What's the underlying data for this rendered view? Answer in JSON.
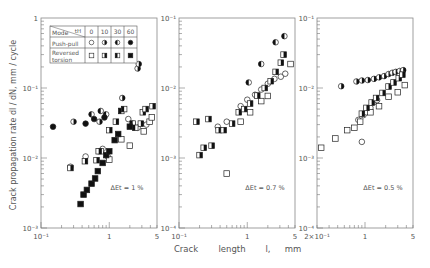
{
  "chart_data": {
    "type": "scatter",
    "title": "",
    "xlabel": "Crack length l, mm",
    "ylabel": "Crack propagation rate dl/dN, mm/cycle",
    "x_scale": "log",
    "y_scale": "log",
    "grid": false,
    "legend": {
      "position": "inside top-left of first panel (table)",
      "header": [
        "Mode \\ tH",
        "0",
        "10",
        "30",
        "60"
      ],
      "rows": [
        {
          "mode": "Push-pull",
          "markers": [
            "open circle",
            "right-half-filled circle",
            "left-half-filled circle",
            "filled circle"
          ]
        },
        {
          "mode": "Reversed torsion",
          "markers": [
            "open square",
            "right-half-filled square",
            "left-half-filled square",
            "filled square"
          ]
        }
      ]
    },
    "panels": [
      {
        "annotation": "ΔEt = 1 %",
        "xlim": [
          0.1,
          5
        ],
        "ylim": [
          0.001,
          1
        ],
        "x_ticks": [
          "10⁻¹",
          "1",
          "5"
        ],
        "y_ticks": [
          "10⁻³",
          "10⁻²",
          "10⁻¹",
          "1"
        ],
        "series": [
          {
            "name": "Push-pull tH=0",
            "marker": "circle",
            "fill": "open",
            "points": [
              [
                0.27,
                0.0075
              ],
              [
                0.45,
                0.0105
              ],
              [
                0.8,
                0.0135
              ],
              [
                0.95,
                0.0105
              ],
              [
                1.9,
                0.036
              ],
              [
                2.2,
                0.031
              ],
              [
                2.6,
                0.027
              ],
              [
                3.5,
                0.03
              ]
            ]
          },
          {
            "name": "Push-pull tH=10",
            "marker": "circle",
            "fill": "right",
            "points": [
              [
                0.3,
                0.033
              ],
              [
                0.72,
                0.033
              ],
              [
                1.55,
                0.072
              ],
              [
                2.6,
                0.19
              ],
              [
                2.7,
                0.22
              ]
            ]
          },
          {
            "name": "Push-pull tH=30",
            "marker": "circle",
            "fill": "left",
            "points": [
              [
                0.55,
                0.042
              ],
              [
                0.75,
                0.047
              ],
              [
                0.9,
                0.042
              ]
            ]
          },
          {
            "name": "Push-pull tH=60",
            "marker": "circle",
            "fill": "full",
            "points": [
              [
                0.15,
                0.028
              ],
              [
                0.45,
                0.031
              ],
              [
                0.6,
                0.036
              ],
              [
                0.85,
                0.038
              ]
            ]
          },
          {
            "name": "Reversed torsion tH=0",
            "marker": "square",
            "fill": "open",
            "points": [
              [
                0.75,
                0.0125
              ],
              [
                1.0,
                0.0095
              ],
              [
                1.5,
                0.0185
              ],
              [
                2.0,
                0.015
              ],
              [
                3.2,
                0.024
              ],
              [
                3.9,
                0.033
              ],
              [
                4.2,
                0.038
              ]
            ]
          },
          {
            "name": "Reversed torsion tH=10",
            "marker": "square",
            "fill": "right",
            "points": [
              [
                0.27,
                0.0072
              ],
              [
                0.44,
                0.009
              ],
              [
                0.65,
                0.0093
              ],
              [
                0.7,
                0.0125
              ],
              [
                1.0,
                0.025
              ],
              [
                1.25,
                0.033
              ],
              [
                2.9,
                0.031
              ],
              [
                3.1,
                0.045
              ],
              [
                3.4,
                0.05
              ],
              [
                4.3,
                0.055
              ]
            ]
          },
          {
            "name": "Reversed torsion tH=30",
            "marker": "square",
            "fill": "left",
            "points": [
              [
                1.5,
                0.047
              ],
              [
                1.65,
                0.05
              ],
              [
                2.2,
                0.031
              ],
              [
                2.4,
                0.027
              ]
            ]
          },
          {
            "name": "Reversed torsion tH=60",
            "marker": "square",
            "fill": "full",
            "points": [
              [
                0.38,
                0.0022
              ],
              [
                0.42,
                0.003
              ],
              [
                0.47,
                0.0035
              ],
              [
                0.55,
                0.0043
              ],
              [
                0.62,
                0.0051
              ],
              [
                0.68,
                0.0065
              ],
              [
                0.8,
                0.0085
              ],
              [
                0.9,
                0.011
              ],
              [
                1.0,
                0.0125
              ],
              [
                1.2,
                0.018
              ],
              [
                1.35,
                0.022
              ],
              [
                2.0,
                0.028
              ]
            ]
          }
        ]
      },
      {
        "annotation": "ΔEt = 0.7 %",
        "xlim": [
          0.1,
          5
        ],
        "ylim": [
          0.0001,
          0.1
        ],
        "x_ticks": [
          "10⁻¹",
          "1",
          "5"
        ],
        "y_ticks": [
          "10⁻⁴",
          "10⁻³",
          "10⁻²",
          "10⁻¹"
        ],
        "series": [
          {
            "name": "Push-pull tH=0",
            "marker": "circle",
            "fill": "open",
            "points": [
              [
                0.37,
                0.0028
              ],
              [
                0.5,
                0.0033
              ],
              [
                0.8,
                0.0055
              ],
              [
                1.0,
                0.0068
              ],
              [
                1.3,
                0.008
              ],
              [
                1.6,
                0.0095
              ],
              [
                2.0,
                0.0115
              ],
              [
                2.5,
                0.0135
              ],
              [
                3.1,
                0.0145
              ],
              [
                3.6,
                0.016
              ]
            ]
          },
          {
            "name": "Push-pull tH=10",
            "marker": "circle",
            "fill": "right",
            "points": []
          },
          {
            "name": "Push-pull tH=30",
            "marker": "circle",
            "fill": "left",
            "points": [
              [
                1.05,
                0.012
              ],
              [
                1.6,
                0.022
              ],
              [
                2.6,
                0.045
              ],
              [
                3.5,
                0.055
              ]
            ]
          },
          {
            "name": "Push-pull tH=60",
            "marker": "circle",
            "fill": "full",
            "points": []
          },
          {
            "name": "Reversed torsion tH=0",
            "marker": "square",
            "fill": "open",
            "points": [
              [
                0.8,
                0.0033
              ],
              [
                1.1,
                0.0045
              ],
              [
                1.6,
                0.0065
              ],
              [
                2.0,
                0.0077
              ],
              [
                4.3,
                0.022
              ],
              [
                0.5,
                0.0006
              ]
            ]
          },
          {
            "name": "Reversed torsion tH=10",
            "marker": "square",
            "fill": "right",
            "points": [
              [
                0.18,
                0.0033
              ],
              [
                0.27,
                0.0036
              ],
              [
                0.2,
                0.0011
              ],
              [
                0.23,
                0.0014
              ],
              [
                0.3,
                0.0015
              ],
              [
                0.38,
                0.0025
              ],
              [
                0.45,
                0.0025
              ],
              [
                0.6,
                0.0031
              ],
              [
                0.75,
                0.0045
              ],
              [
                0.9,
                0.005
              ],
              [
                1.1,
                0.006
              ],
              [
                1.4,
                0.0078
              ],
              [
                1.8,
                0.01
              ],
              [
                2.2,
                0.0125
              ],
              [
                2.6,
                0.017
              ],
              [
                3.1,
                0.023
              ],
              [
                3.4,
                0.03
              ]
            ]
          },
          {
            "name": "Reversed torsion tH=30",
            "marker": "square",
            "fill": "left",
            "points": []
          },
          {
            "name": "Reversed torsion tH=60",
            "marker": "square",
            "fill": "full",
            "points": []
          }
        ]
      },
      {
        "annotation": "ΔEt = 0.5 %",
        "xlim": [
          0.2,
          5
        ],
        "ylim": [
          0.0001,
          0.1
        ],
        "x_ticks": [
          "2×10⁻¹",
          "1",
          "5"
        ],
        "y_ticks": [
          "10⁻⁴",
          "10⁻³",
          "10⁻²",
          "10⁻¹"
        ],
        "series": [
          {
            "name": "Push-pull tH=0",
            "marker": "circle",
            "fill": "open",
            "points": [
              [
                0.8,
                0.0035
              ],
              [
                0.95,
                0.0041
              ],
              [
                1.05,
                0.0045
              ],
              [
                1.2,
                0.0052
              ],
              [
                1.35,
                0.0063
              ],
              [
                1.5,
                0.0067
              ],
              [
                0.9,
                0.0017
              ]
            ]
          },
          {
            "name": "Push-pull tH=10",
            "marker": "circle",
            "fill": "right",
            "points": [
              [
                0.45,
                0.0106
              ],
              [
                0.75,
                0.0124
              ],
              [
                0.9,
                0.0128
              ],
              [
                1.1,
                0.013
              ],
              [
                1.35,
                0.0135
              ],
              [
                1.6,
                0.0142
              ],
              [
                1.9,
                0.0148
              ],
              [
                2.2,
                0.0158
              ],
              [
                2.5,
                0.0165
              ],
              [
                2.8,
                0.017
              ],
              [
                3.2,
                0.0175
              ],
              [
                3.6,
                0.018
              ]
            ]
          },
          {
            "name": "Push-pull tH=30",
            "marker": "circle",
            "fill": "left",
            "points": []
          },
          {
            "name": "Push-pull tH=60",
            "marker": "circle",
            "fill": "full",
            "points": []
          },
          {
            "name": "Reversed torsion tH=0",
            "marker": "square",
            "fill": "open",
            "points": [
              [
                0.23,
                0.0014
              ],
              [
                0.37,
                0.0019
              ],
              [
                0.55,
                0.0025
              ],
              [
                0.7,
                0.0027
              ],
              [
                0.85,
                0.0033
              ],
              [
                1.2,
                0.0045
              ],
              [
                1.6,
                0.0055
              ],
              [
                2.2,
                0.0075
              ],
              [
                3.0,
                0.0087
              ],
              [
                3.8,
                0.011
              ]
            ]
          },
          {
            "name": "Reversed torsion tH=10",
            "marker": "square",
            "fill": "right",
            "points": [
              [
                0.9,
                0.0043
              ],
              [
                1.05,
                0.0052
              ],
              [
                1.25,
                0.0062
              ],
              [
                1.45,
                0.0072
              ],
              [
                1.8,
                0.0085
              ],
              [
                2.2,
                0.0105
              ],
              [
                2.6,
                0.012
              ],
              [
                3.1,
                0.0138
              ],
              [
                3.5,
                0.0155
              ]
            ]
          },
          {
            "name": "Reversed torsion tH=30",
            "marker": "square",
            "fill": "left",
            "points": []
          },
          {
            "name": "Reversed torsion tH=60",
            "marker": "square",
            "fill": "full",
            "points": []
          }
        ]
      }
    ]
  },
  "labels": {
    "ylabel": "Crack   propagation   rate   dl / dN,   mm / cycle",
    "xlabel_parts": [
      "Crack",
      "length",
      "l,",
      "mm"
    ],
    "legend_header_mode": "Mode",
    "legend_header_th": "tH",
    "legend_cols": [
      "0",
      "10",
      "30",
      "60"
    ],
    "legend_row1": "Push-pull",
    "legend_row2a": "Reversed",
    "legend_row2b": "torsion"
  }
}
